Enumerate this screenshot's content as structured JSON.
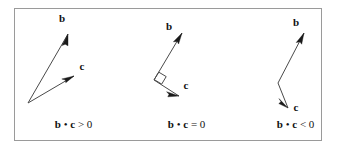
{
  "figure": {
    "background_color": "#ffffff",
    "border_color": "#9a9a9a",
    "line_color": "#4a4a4a",
    "arrowhead_color": "#1a1a1a",
    "text_color": "#111111",
    "frame": {
      "x": 14,
      "y": 8,
      "width": 308,
      "height": 133
    }
  },
  "panels": [
    {
      "id": "acute",
      "caption": {
        "vec1": "b",
        "dot": "•",
        "vec2": "c",
        "relation": ">",
        "value": "0"
      },
      "caption_text": "b • c > 0",
      "caption_x": 30,
      "caption_y": 128,
      "origin": {
        "x": 28,
        "y": 103
      },
      "vectors": [
        {
          "name": "b",
          "label": "b",
          "label_x": 62,
          "label_y": 22,
          "tip": {
            "x": 68,
            "y": 34
          }
        },
        {
          "name": "c",
          "label": "c",
          "label_x": 82,
          "label_y": 70,
          "tip": {
            "x": 74,
            "y": 76
          }
        }
      ],
      "right_angle": null
    },
    {
      "id": "perpendicular",
      "caption": {
        "vec1": "b",
        "dot": "•",
        "vec2": "c",
        "relation": "=",
        "value": "0"
      },
      "caption_text": "b • c = 0",
      "caption_x": 143,
      "caption_y": 128,
      "origin": {
        "x": 154,
        "y": 80
      },
      "vectors": [
        {
          "name": "b",
          "label": "b",
          "label_x": 169,
          "label_y": 30,
          "tip": {
            "x": 182,
            "y": 33
          }
        },
        {
          "name": "c",
          "label": "c",
          "label_x": 185,
          "label_y": 89,
          "tip": {
            "x": 179,
            "y": 96
          }
        }
      ],
      "right_angle": {
        "size": 9
      }
    },
    {
      "id": "obtuse",
      "caption": {
        "vec1": "b",
        "dot": "•",
        "vec2": "c",
        "relation": "<",
        "value": "0"
      },
      "caption_text": "b • c < 0",
      "caption_x": 252,
      "caption_y": 128,
      "origin": {
        "x": 278,
        "y": 83
      },
      "vectors": [
        {
          "name": "b",
          "label": "b",
          "label_x": 296,
          "label_y": 26,
          "tip": {
            "x": 304,
            "y": 33
          }
        },
        {
          "name": "c",
          "label": "c",
          "label_x": 294,
          "label_y": 111,
          "tip": {
            "x": 288,
            "y": 108
          }
        }
      ],
      "right_angle": null
    }
  ]
}
